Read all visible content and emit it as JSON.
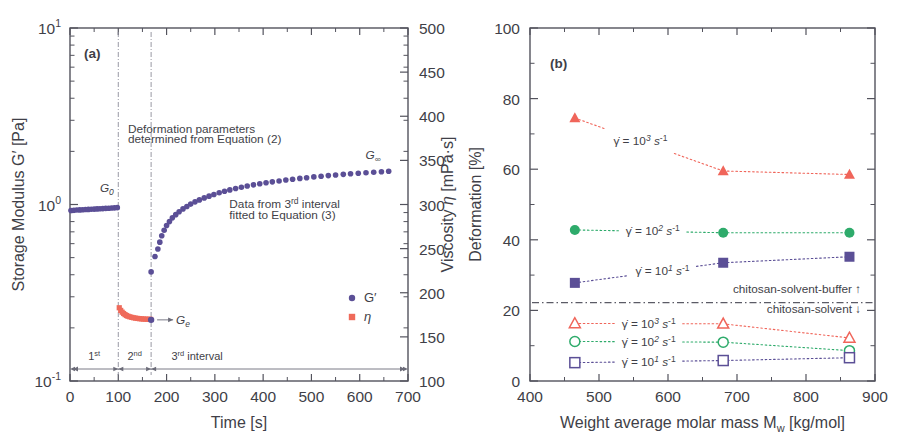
{
  "figure": {
    "panels": [
      {
        "tag": "(a)"
      },
      {
        "tag": "(b)"
      }
    ]
  },
  "chart_data": [
    {
      "type": "line",
      "panel": "(a)",
      "title": "",
      "xlabel": "Time [s]",
      "ylabel": "Storage Modulus G′ [Pa]",
      "ylabel_right": "Viscosity η [mPa·s]",
      "xlim": [
        0,
        700
      ],
      "xticks": [
        0,
        100,
        200,
        300,
        400,
        500,
        600,
        700
      ],
      "yscale": "log",
      "ylim": [
        0.1,
        10
      ],
      "yticks": [
        0.1,
        1,
        10
      ],
      "ytick_labels": [
        "10⁻¹",
        "10⁰",
        "10¹"
      ],
      "ylim_right": [
        100,
        500
      ],
      "yticks_right": [
        100,
        150,
        200,
        250,
        300,
        350,
        400,
        450,
        500
      ],
      "grid": false,
      "legend_position": "lower-right",
      "series": [
        {
          "name": "G′",
          "symbol": "circle",
          "color": "#5b4f96",
          "axis": "left",
          "legend_label": "G′",
          "points": [
            [
              2,
              0.925
            ],
            [
              8,
              0.928
            ],
            [
              14,
              0.93
            ],
            [
              20,
              0.932
            ],
            [
              26,
              0.934
            ],
            [
              32,
              0.936
            ],
            [
              38,
              0.938
            ],
            [
              44,
              0.94
            ],
            [
              50,
              0.942
            ],
            [
              56,
              0.944
            ],
            [
              62,
              0.946
            ],
            [
              68,
              0.948
            ],
            [
              74,
              0.951
            ],
            [
              80,
              0.953
            ],
            [
              86,
              0.955
            ],
            [
              92,
              0.957
            ],
            [
              98,
              0.96
            ],
            [
              168,
              0.415
            ],
            [
              176,
              0.507
            ],
            [
              182,
              0.56
            ],
            [
              186,
              0.612
            ],
            [
              190,
              0.665
            ],
            [
              195,
              0.715
            ],
            [
              200,
              0.76
            ],
            [
              206,
              0.8
            ],
            [
              212,
              0.84
            ],
            [
              219,
              0.876
            ],
            [
              226,
              0.91
            ],
            [
              234,
              0.944
            ],
            [
              242,
              0.975
            ],
            [
              250,
              1.005
            ],
            [
              259,
              1.035
            ],
            [
              268,
              1.062
            ],
            [
              278,
              1.09
            ],
            [
              288,
              1.115
            ],
            [
              298,
              1.14
            ],
            [
              309,
              1.165
            ],
            [
              320,
              1.188
            ],
            [
              331,
              1.21
            ],
            [
              343,
              1.232
            ],
            [
              355,
              1.253
            ],
            [
              367,
              1.273
            ],
            [
              380,
              1.292
            ],
            [
              393,
              1.31
            ],
            [
              406,
              1.327
            ],
            [
              419,
              1.344
            ],
            [
              433,
              1.36
            ],
            [
              447,
              1.376
            ],
            [
              461,
              1.391
            ],
            [
              476,
              1.406
            ],
            [
              490,
              1.419
            ],
            [
              505,
              1.433
            ],
            [
              520,
              1.446
            ],
            [
              535,
              1.458
            ],
            [
              550,
              1.47
            ],
            [
              566,
              1.482
            ],
            [
              581,
              1.493
            ],
            [
              597,
              1.503
            ],
            [
              613,
              1.514
            ],
            [
              629,
              1.524
            ],
            [
              645,
              1.534
            ],
            [
              660,
              1.543
            ]
          ]
        },
        {
          "name": "η",
          "symbol": "square",
          "color": "#ef6a5a",
          "axis": "right",
          "legend_label": "η",
          "points": [
            [
              102,
              183
            ],
            [
              105,
              180
            ],
            [
              108,
              178
            ],
            [
              111,
              176.5
            ],
            [
              114,
              175.2
            ],
            [
              117,
              174.2
            ],
            [
              120,
              173.4
            ],
            [
              124,
              172.7
            ],
            [
              128,
              172.1
            ],
            [
              132,
              171.6
            ],
            [
              136,
              171.2
            ],
            [
              140,
              170.9
            ],
            [
              144,
              170.6
            ],
            [
              148,
              170.4
            ],
            [
              152,
              170.2
            ],
            [
              156,
              170.1
            ],
            [
              160,
              170.0
            ],
            [
              164,
              169.9
            ],
            [
              167,
              169.8
            ]
          ]
        }
      ],
      "isolated_points": [
        {
          "x": 168,
          "y": 0.222,
          "label": "Gₑ",
          "series": "G′"
        }
      ],
      "annotations": [
        {
          "text": "Deformation parameters",
          "x": 120,
          "y": 2.55
        },
        {
          "text": "determined from Equation (2)",
          "x": 120,
          "y": 2.22
        },
        {
          "text": "Data from 3ʳᵈ interval",
          "x": 330,
          "y": 0.95
        },
        {
          "text": "fitted to Equation (3)",
          "x": 330,
          "y": 0.83
        },
        {
          "text": "G₀",
          "x": 62,
          "y": 1.18
        },
        {
          "text": "G∞",
          "x": 612,
          "y": 1.82
        }
      ],
      "interval_markers": [
        {
          "label": "1ˢᵗ",
          "from": 0,
          "to": 100
        },
        {
          "label": "2ⁿᵈ",
          "from": 100,
          "to": 168
        },
        {
          "label": "3ʳᵈ  interval",
          "from": 168,
          "to": 700
        }
      ],
      "guide_lines_x": [
        100,
        168
      ]
    },
    {
      "type": "line",
      "panel": "(b)",
      "title": "",
      "xlabel": "Weight average molar mass Mᵥᵥ [kg/mol]",
      "xlabel_parts": {
        "main": "Weight average molar mass M",
        "sub": "w",
        "unit": " [kg/mol]"
      },
      "ylabel": "Deformation [%]",
      "xlim": [
        400,
        900
      ],
      "xticks": [
        400,
        500,
        600,
        700,
        800,
        900
      ],
      "ylim": [
        0,
        100
      ],
      "yticks": [
        0,
        20,
        40,
        60,
        80,
        100
      ],
      "grid": false,
      "legend_position": "inline-annotations",
      "categories": [
        465,
        680,
        863
      ],
      "series": [
        {
          "name": "chitosan-solvent-buffer, shear rate 10³ s⁻¹",
          "symbol": "triangle-filled",
          "color": "#f0655a",
          "label": "γ̇ = 10³ s⁻¹",
          "label_x": 560,
          "values": [
            74.5,
            59.5,
            58.5
          ]
        },
        {
          "name": "chitosan-solvent-buffer, shear rate 10² s⁻¹",
          "symbol": "circle-filled",
          "color": "#2eab6b",
          "label": "γ̇ = 10² s⁻¹",
          "label_x": 578,
          "values": [
            42.8,
            42.0,
            42.0
          ]
        },
        {
          "name": "chitosan-solvent-buffer, shear rate 10¹ s⁻¹",
          "symbol": "square-filled",
          "color": "#5b4f96",
          "label": "γ̇ = 10¹ s⁻¹",
          "label_x": 592,
          "values": [
            27.8,
            33.5,
            35.2
          ]
        },
        {
          "name": "chitosan-solvent, shear rate 10³ s⁻¹",
          "symbol": "triangle-open",
          "color": "#f0655a",
          "label": "γ̇ = 10³ s⁻¹",
          "label_x": 572,
          "values": [
            16.3,
            16.2,
            12.2
          ]
        },
        {
          "name": "chitosan-solvent, shear rate 10² s⁻¹",
          "symbol": "circle-open",
          "color": "#2eab6b",
          "label": "γ̇ = 10² s⁻¹",
          "label_x": 572,
          "values": [
            11.2,
            11.0,
            8.6
          ]
        },
        {
          "name": "chitosan-solvent, shear rate 10¹ s⁻¹",
          "symbol": "square-open",
          "color": "#5b4f96",
          "label": "γ̇ = 10¹ s⁻¹",
          "label_x": 572,
          "values": [
            5.2,
            5.8,
            6.6
          ]
        }
      ],
      "divider": {
        "y": 22.2,
        "style": "dash-dot"
      },
      "annotations": [
        {
          "text": "chitosan-solvent-buffer ↑",
          "x": 880,
          "y": 25.0,
          "anchor": "end"
        },
        {
          "text": "chitosan-solvent ↓",
          "x": 880,
          "y": 19.4,
          "anchor": "end"
        }
      ]
    }
  ]
}
